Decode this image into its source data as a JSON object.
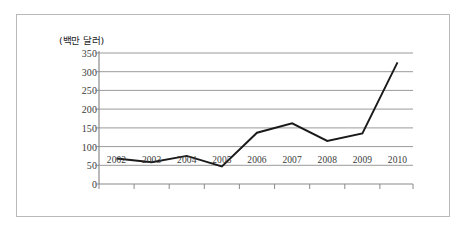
{
  "chart_data": {
    "type": "line",
    "title": "",
    "subtitle": "",
    "unit_label": "(백만 달러)",
    "xlabel": "",
    "ylabel": "",
    "categories": [
      "2002",
      "2003",
      "2004",
      "2005",
      "2006",
      "2007",
      "2008",
      "2009",
      "2010"
    ],
    "values": [
      68,
      58,
      75,
      47,
      137,
      162,
      115,
      135,
      325
    ],
    "series": [
      {
        "name": "",
        "values": [
          68,
          58,
          75,
          47,
          137,
          162,
          115,
          135,
          325
        ]
      }
    ],
    "ylim": [
      0,
      350
    ],
    "y_ticks": [
      "0",
      "50",
      "100",
      "150",
      "200",
      "250",
      "300",
      "350"
    ],
    "y_tick_values": [
      0,
      50,
      100,
      150,
      200,
      250,
      300,
      350
    ],
    "grid": "horizontal",
    "legend": "none",
    "line_color": "#1a1a1a",
    "grid_color": "#9a9a9a",
    "axis_color": "#8a8a8a",
    "border_color": "#b9b9b9",
    "background_color": "#ffffff"
  }
}
